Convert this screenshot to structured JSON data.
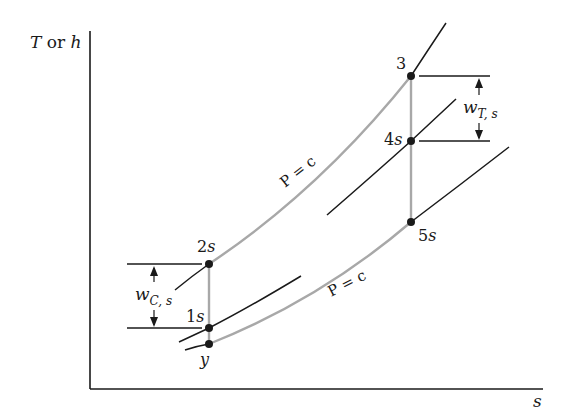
{
  "diagram": {
    "type": "thermodynamic T-s / h-s diagram (isentropic compression and expansion)",
    "axes": {
      "y_label_var1": "T",
      "y_label_or": " or ",
      "y_label_var2": "h",
      "x_label": "s"
    },
    "points": [
      {
        "id": "3",
        "label": "3"
      },
      {
        "id": "4s",
        "label_num": "4",
        "label_sub": "s"
      },
      {
        "id": "5s",
        "label_num": "5",
        "label_sub": "s"
      },
      {
        "id": "2s",
        "label_num": "2",
        "label_sub": "s"
      },
      {
        "id": "1s",
        "label_num": "1",
        "label_sub": "s"
      },
      {
        "id": "y",
        "label": "y"
      }
    ],
    "isobar_labels": [
      {
        "id": "upper",
        "text": "P = c"
      },
      {
        "id": "lower",
        "text": "P = c"
      }
    ],
    "work_annotations": {
      "turbine": {
        "main": "w",
        "sub": "T, s"
      },
      "compressor": {
        "main": "w",
        "sub": "C, s"
      }
    },
    "colors": {
      "line": "#1a1a1a",
      "process_line": "#a8a8a8",
      "background": "#ffffff"
    }
  }
}
